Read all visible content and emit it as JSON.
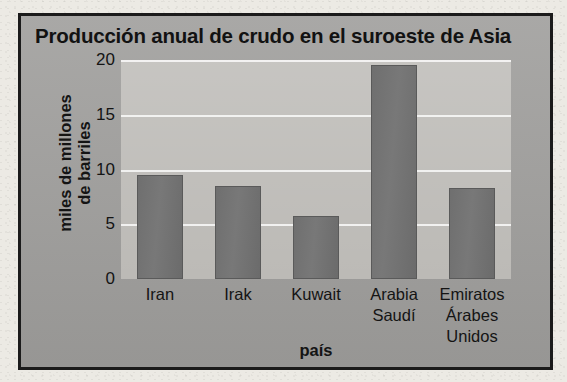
{
  "figure": {
    "title": "Producción anual de crudo en el suroeste de Asia",
    "xaxis_title": "país",
    "yaxis_title_line1": "miles de millones",
    "yaxis_title_line2": "de barriles"
  },
  "ticks": {
    "y": [
      "20",
      "15",
      "10",
      "5",
      "0"
    ]
  },
  "categories": [
    {
      "line1": "Iran",
      "line2": "",
      "line3": ""
    },
    {
      "line1": "Irak",
      "line2": "",
      "line3": ""
    },
    {
      "line1": "Kuwait",
      "line2": "",
      "line3": ""
    },
    {
      "line1": "Arabia",
      "line2": "Saudí",
      "line3": ""
    },
    {
      "line1": "Emiratos",
      "line2": "Árabes",
      "line3": "Unidos"
    }
  ],
  "colors": {
    "bar": "#727272",
    "plot_background": "#bcbab6",
    "figure_background": "#9f9e9c",
    "frame": "#1b1b1b",
    "gridline": "#ffffff",
    "text": "#141414"
  },
  "chart_data": {
    "type": "bar",
    "title": "Producción anual de crudo en el suroeste de Asia",
    "xlabel": "país",
    "ylabel": "miles de millones de barriles",
    "categories": [
      "Iran",
      "Irak",
      "Kuwait",
      "Arabia Saudí",
      "Emiratos Árabes Unidos"
    ],
    "values": [
      9.5,
      8.5,
      5.8,
      19.5,
      8.3
    ],
    "ylim": [
      0,
      20
    ],
    "yticks": [
      0,
      5,
      10,
      15,
      20
    ],
    "grid": true,
    "legend": false
  }
}
